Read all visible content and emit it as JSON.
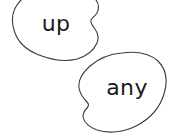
{
  "canvas": {
    "width": 173,
    "height": 133,
    "background_color": "#ffffff"
  },
  "style": {
    "outline_color": "#3a3a3a",
    "outline_width": 1.1,
    "fill_color": "#ffffff",
    "text_color": "#1a1a1a"
  },
  "blobs": [
    {
      "id": "blob-up",
      "label": "up",
      "label_x": 56,
      "label_y": 31,
      "font_size": 22,
      "outline_color": "#3a3a3a",
      "fill_color": "#ffffff",
      "path": "M 63 -14 C 45 -14 30 -9 21 0 C 12 9 11 20 14 30 C 17 41 26 50 39 55 C 52 60 66 62 77 59 C 87 56 94 50 97 43 C 99 38 98 33 95 29 C 92 25 90 22 91 20 C 92 18 95 16 97 13 C 99 9 99 4 96 0 C 92 -6 85 -11 77 -13 C 73 -14 68 -14 63 -14 Z"
    },
    {
      "id": "blob-any",
      "label": "any",
      "label_x": 127,
      "label_y": 95,
      "font_size": 22,
      "outline_color": "#3a3a3a",
      "fill_color": "#ffffff",
      "path": "M 122 53 C 109 54 98 59 90 66 C 82 73 78 81 79 88 C 80 94 84 99 87 102 C 89 104 89 106 87 108 C 85 110 83 113 83 117 C 84 122 89 127 97 130 C 109 134 124 132 136 126 C 150 119 160 107 164 94 C 168 81 166 69 158 61 C 150 54 137 51 122 53 Z"
    }
  ]
}
